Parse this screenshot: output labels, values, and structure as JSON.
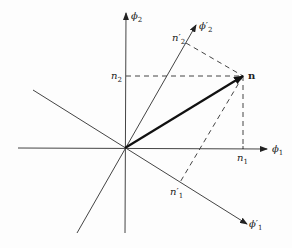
{
  "diagram": {
    "title": "",
    "axes": {
      "phi1": {
        "symbol": "ϕ",
        "sub": "1",
        "prime": ""
      },
      "phi2": {
        "symbol": "ϕ",
        "sub": "2",
        "prime": ""
      },
      "phi1p": {
        "symbol": "ϕ",
        "sub": "1",
        "prime": "′"
      },
      "phi2p": {
        "symbol": "ϕ",
        "sub": "2",
        "prime": "′"
      }
    },
    "projections": {
      "n1": {
        "symbol": "n",
        "sub": "1",
        "prime": ""
      },
      "n2": {
        "symbol": "n",
        "sub": "2",
        "prime": ""
      },
      "n1p": {
        "symbol": "n",
        "sub": "1",
        "prime": "′"
      },
      "n2p": {
        "symbol": "n",
        "sub": "2",
        "prime": "′"
      }
    },
    "vector": {
      "label": "n"
    },
    "colors": {
      "line": "#333333",
      "vector": "#111111",
      "background": "#fdfdfd"
    }
  }
}
